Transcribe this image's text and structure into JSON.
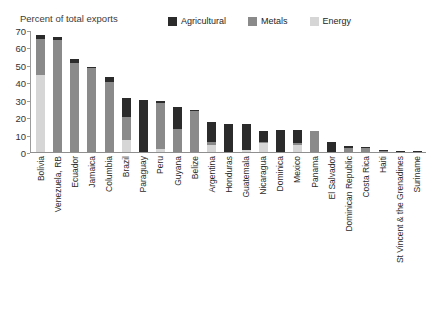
{
  "title": {
    "text": "",
    "visible_note": "clipped"
  },
  "axis": {
    "ylabel": "Percent of total exports",
    "yticks": [
      0,
      10,
      20,
      30,
      40,
      50,
      60,
      70
    ],
    "ymin": 0,
    "ymax": 70
  },
  "legend": {
    "position": "top-center",
    "items": [
      {
        "label": "Agricultural",
        "color": "#2b2b2b"
      },
      {
        "label": "Metals",
        "color": "#8a8a8a"
      },
      {
        "label": "Energy",
        "color": "#d6d6d6"
      }
    ]
  },
  "chart_data": {
    "type": "bar",
    "subtype": "stacked-vertical",
    "title": "",
    "xlabel": "",
    "ylabel": "Percent of total exports",
    "ylim": [
      0,
      70
    ],
    "grid": false,
    "legend_position": "top-center",
    "categories": [
      "Bolivia",
      "Venezuela, RB",
      "Ecuador",
      "Jamaica",
      "Columbia",
      "Brazil",
      "Paraguay",
      "Peru",
      "Guyana",
      "Belize",
      "Argentina",
      "Honduras",
      "Guatemala",
      "Nicaragua",
      "Dominica",
      "Mexico",
      "Panama",
      "El Salvador",
      "Dominican Republic",
      "Costa Rica",
      "Haiti",
      "St Vincent & the Grenadines",
      "Suriname"
    ],
    "series": [
      {
        "name": "Energy",
        "color": "#d6d6d6",
        "values": [
          44,
          0,
          0,
          0,
          0,
          7,
          0,
          2,
          0,
          0,
          4,
          0,
          1,
          5,
          0,
          4,
          0,
          0,
          0,
          0,
          0,
          0,
          0
        ]
      },
      {
        "name": "Metals",
        "color": "#8a8a8a",
        "values": [
          21,
          64,
          51,
          48,
          40,
          13,
          0,
          26,
          13,
          23.5,
          2,
          0,
          0,
          1,
          0,
          1,
          12,
          0,
          2.5,
          2.5,
          0.6,
          0,
          0
        ]
      },
      {
        "name": "Agricultural",
        "color": "#2b2b2b",
        "values": [
          2,
          2,
          2.5,
          0.5,
          3,
          11,
          30,
          1,
          13,
          0.5,
          11,
          16,
          15,
          6,
          12.5,
          7.5,
          0,
          6,
          1,
          0.5,
          0.7,
          0.5,
          0.4
        ]
      }
    ],
    "totals": [
      67,
      66,
      53.5,
      48.5,
      43,
      31,
      30,
      29,
      26,
      24,
      17,
      16,
      16,
      12,
      12.5,
      12.5,
      12,
      6,
      3.5,
      3,
      1.3,
      0.5,
      0.4
    ]
  }
}
